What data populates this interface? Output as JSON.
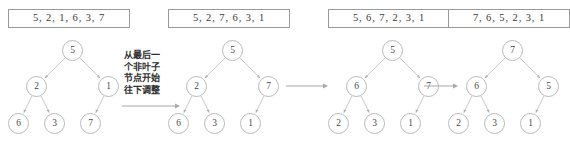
{
  "figure": {
    "colors": {
      "background": "#ffffff",
      "box_border": "#9a9a9a",
      "node_border": "#b9b9b9",
      "edge": "#c9c9c9",
      "text": "#3a3a3a",
      "annotation_text": "#2c2c2c"
    }
  },
  "annotation": {
    "lines": [
      "从最后一",
      "个非叶子",
      "节点开始",
      "往下调整"
    ],
    "full_text": "从最后一个非叶子节点开始往下调整"
  },
  "panels": [
    {
      "id": "step-1",
      "array_text": "5, 2, 1, 6, 3, 7",
      "array_values": [
        5,
        2,
        1,
        6,
        3,
        7
      ],
      "nodes": [
        {
          "label": "5",
          "x": 62,
          "y": 8,
          "role": "root"
        },
        {
          "label": "2",
          "x": 26,
          "y": 44,
          "role": "internal"
        },
        {
          "label": "1",
          "x": 98,
          "y": 44,
          "role": "internal"
        },
        {
          "label": "6",
          "x": 8,
          "y": 81,
          "role": "leaf"
        },
        {
          "label": "3",
          "x": 44,
          "y": 81,
          "role": "leaf"
        },
        {
          "label": "7",
          "x": 80,
          "y": 81,
          "role": "leaf"
        }
      ],
      "edges": [
        [
          0,
          1
        ],
        [
          0,
          2
        ],
        [
          1,
          3
        ],
        [
          1,
          4
        ],
        [
          2,
          5
        ]
      ]
    },
    {
      "id": "step-2",
      "array_text": "5, 2, 7, 6, 3, 1",
      "array_values": [
        5,
        2,
        7,
        6,
        3,
        1
      ],
      "nodes": [
        {
          "label": "5",
          "x": 62,
          "y": 8,
          "role": "root"
        },
        {
          "label": "2",
          "x": 26,
          "y": 44,
          "role": "internal"
        },
        {
          "label": "7",
          "x": 98,
          "y": 44,
          "role": "internal"
        },
        {
          "label": "6",
          "x": 8,
          "y": 81,
          "role": "leaf"
        },
        {
          "label": "3",
          "x": 44,
          "y": 81,
          "role": "leaf"
        },
        {
          "label": "1",
          "x": 80,
          "y": 81,
          "role": "leaf"
        }
      ],
      "edges": [
        [
          0,
          1
        ],
        [
          0,
          2
        ],
        [
          1,
          3
        ],
        [
          1,
          4
        ],
        [
          2,
          5
        ]
      ]
    },
    {
      "id": "step-3",
      "array_text": "5, 6, 7, 2, 3, 1",
      "array_values": [
        5,
        6,
        7,
        2,
        3,
        1
      ],
      "nodes": [
        {
          "label": "5",
          "x": 62,
          "y": 8,
          "role": "root"
        },
        {
          "label": "6",
          "x": 26,
          "y": 44,
          "role": "internal"
        },
        {
          "label": "7",
          "x": 98,
          "y": 44,
          "role": "internal"
        },
        {
          "label": "2",
          "x": 8,
          "y": 81,
          "role": "leaf"
        },
        {
          "label": "3",
          "x": 44,
          "y": 81,
          "role": "leaf"
        },
        {
          "label": "1",
          "x": 80,
          "y": 81,
          "role": "leaf"
        }
      ],
      "edges": [
        [
          0,
          1
        ],
        [
          0,
          2
        ],
        [
          1,
          3
        ],
        [
          1,
          4
        ],
        [
          2,
          5
        ]
      ]
    },
    {
      "id": "step-4",
      "array_text": "7, 6, 5, 2, 3, 1",
      "array_values": [
        7,
        6,
        5,
        2,
        3,
        1
      ],
      "nodes": [
        {
          "label": "7",
          "x": 62,
          "y": 8,
          "role": "root"
        },
        {
          "label": "6",
          "x": 26,
          "y": 44,
          "role": "internal"
        },
        {
          "label": "5",
          "x": 98,
          "y": 44,
          "role": "internal"
        },
        {
          "label": "2",
          "x": 8,
          "y": 81,
          "role": "leaf"
        },
        {
          "label": "3",
          "x": 44,
          "y": 81,
          "role": "leaf"
        },
        {
          "label": "1",
          "x": 80,
          "y": 81,
          "role": "leaf"
        }
      ],
      "edges": [
        [
          0,
          1
        ],
        [
          0,
          2
        ],
        [
          1,
          3
        ],
        [
          1,
          4
        ],
        [
          2,
          5
        ]
      ]
    }
  ],
  "panel_offsets": [
    0,
    160,
    320,
    440
  ],
  "arrows": [
    {
      "id": "arrow-1-2",
      "x": 122,
      "y": 101,
      "width": 58
    },
    {
      "id": "arrow-2-3",
      "x": 286,
      "y": 81,
      "width": 42
    },
    {
      "id": "arrow-3-4",
      "x": 424,
      "y": 81,
      "width": 34
    }
  ]
}
